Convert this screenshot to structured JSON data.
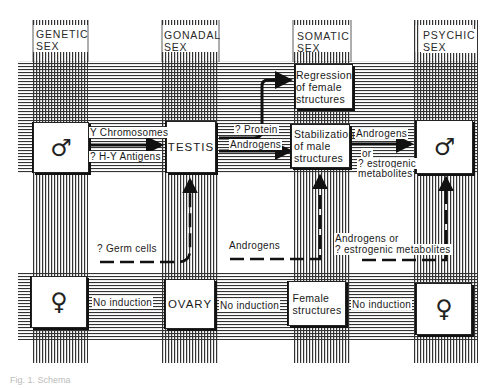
{
  "headers": {
    "genetic": [
      "GENETIC",
      "SEX"
    ],
    "gonadal": [
      "GONADAL",
      "SEX"
    ],
    "somatic": [
      "SOMATIC",
      "SEX"
    ],
    "psychic": [
      "PSYCHIC",
      "SEX"
    ]
  },
  "male_row": {
    "genetic_symbol": "♂",
    "gonad": "TESTIS",
    "somatic_top": [
      "Regression",
      "of female",
      "structures"
    ],
    "somatic_main": [
      "Stabilization",
      "of male",
      "structures"
    ],
    "psychic_symbol": "♂"
  },
  "female_row": {
    "genetic_symbol": "♀",
    "gonad": "OVARY",
    "somatic": [
      "Female",
      "structures"
    ],
    "psychic_symbol": "♀"
  },
  "arrow_labels": {
    "y_chromosomes": "Y Chromosomes",
    "hy_antigens": "? H-Y Antigens",
    "protein": "? Protein",
    "androgens_testis": "Androgens",
    "androgens_psychic": "Androgens",
    "or": "or",
    "estrogenic": "? estrogenic",
    "metabolites": "metabolites",
    "germ_cells": "? Germ cells",
    "androgens_dashed": "Androgens",
    "androgens_or": "Androgens or",
    "estrogenic_metabolites": "? estrogenic metabolites",
    "no_induction_1": "No induction",
    "no_induction_2": "No induction",
    "no_induction_3": "No induction"
  },
  "caption": "Fig. 1. Schema"
}
